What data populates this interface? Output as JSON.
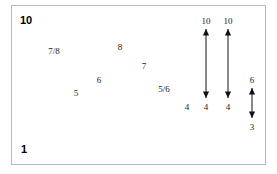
{
  "figure": {
    "corner_labels": [
      {
        "name": "top-left-scale-label",
        "text": "10",
        "x": 20,
        "y": 14
      },
      {
        "name": "bottom-left-scale-label",
        "text": "1",
        "x": 21,
        "y": 143
      }
    ],
    "scatter_labels": [
      {
        "name": "point-label-7-8",
        "text": "7/8",
        "x": 54,
        "y": 51
      },
      {
        "name": "point-label-5",
        "text": "5",
        "x": 76,
        "y": 93
      },
      {
        "name": "point-label-6",
        "text": "6",
        "x": 99,
        "y": 80
      },
      {
        "name": "point-label-8",
        "text": "8",
        "x": 120,
        "y": 47
      },
      {
        "name": "point-label-7",
        "text": "7",
        "x": 144,
        "y": 66
      },
      {
        "name": "point-label-5-6",
        "text": "5/6",
        "x": 164,
        "y": 89
      },
      {
        "name": "point-label-4",
        "text": "4",
        "x": 187,
        "y": 107
      }
    ],
    "arrows": [
      {
        "name": "range-arrow-1",
        "x": 206,
        "top_y": 29,
        "bottom_y": 98,
        "top_label": "10",
        "bottom_label": "4",
        "top_label_y": 21,
        "bottom_label_y": 107
      },
      {
        "name": "range-arrow-2",
        "x": 228,
        "top_y": 29,
        "bottom_y": 98,
        "top_label": "10",
        "bottom_label": "4",
        "top_label_y": 21,
        "bottom_label_y": 107
      },
      {
        "name": "range-arrow-3",
        "x": 252,
        "top_y": 88,
        "bottom_y": 118,
        "top_label": "6",
        "bottom_label": "3",
        "top_label_y": 80,
        "bottom_label_y": 127
      }
    ],
    "style": {
      "stroke_color": "#111111",
      "frame_color": "#b9b9b9",
      "background": "#ffffff"
    }
  }
}
